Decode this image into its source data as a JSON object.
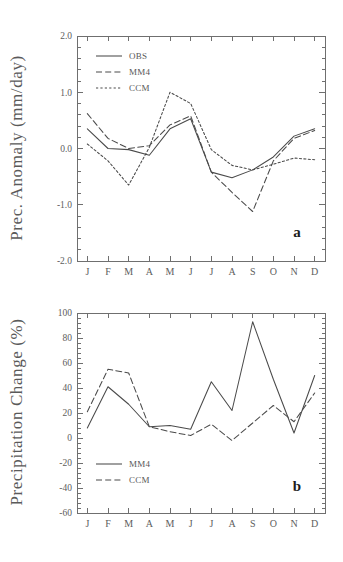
{
  "figure": {
    "panel_a_label": "a",
    "panel_b_label": "b"
  },
  "chart_data": [
    {
      "type": "line",
      "panel": "a",
      "title": "",
      "xlabel": "",
      "ylabel": "Prec. Anomaly (mm/day)",
      "categories": [
        "J",
        "F",
        "M",
        "A",
        "M",
        "J",
        "J",
        "A",
        "S",
        "O",
        "N",
        "D"
      ],
      "xtick_labels": [
        "J",
        "F",
        "M",
        "A",
        "M",
        "J",
        "J",
        "A",
        "S",
        "O",
        "N",
        "D"
      ],
      "ytick_labels": [
        "2.0",
        "1.0",
        "0.0",
        "-1.0",
        "-2.0"
      ],
      "ytick_values": [
        2.0,
        1.0,
        0.0,
        -1.0,
        -2.0
      ],
      "ylim": [
        -2.0,
        2.0
      ],
      "grid": false,
      "legend_position": "upper-left",
      "series": [
        {
          "name": "OBS",
          "style": "solid",
          "values": [
            0.35,
            0.0,
            -0.02,
            -0.12,
            0.35,
            0.53,
            -0.42,
            -0.52,
            -0.38,
            -0.15,
            0.22,
            0.35
          ]
        },
        {
          "name": "MM4",
          "style": "dashed",
          "values": [
            0.62,
            0.18,
            0.0,
            0.05,
            0.42,
            0.58,
            -0.42,
            -0.78,
            -1.12,
            -0.22,
            0.18,
            0.32
          ]
        },
        {
          "name": "CCM",
          "style": "dotted",
          "values": [
            0.08,
            -0.22,
            -0.65,
            0.02,
            1.0,
            0.8,
            -0.02,
            -0.3,
            -0.38,
            -0.28,
            -0.17,
            -0.2
          ]
        }
      ]
    },
    {
      "type": "line",
      "panel": "b",
      "title": "",
      "xlabel": "",
      "ylabel": "Precipitation Change (%)",
      "categories": [
        "J",
        "F",
        "M",
        "A",
        "M",
        "J",
        "J",
        "A",
        "S",
        "O",
        "N",
        "D"
      ],
      "xtick_labels": [
        "J",
        "F",
        "M",
        "A",
        "M",
        "J",
        "J",
        "A",
        "S",
        "O",
        "N",
        "D"
      ],
      "ytick_labels": [
        "100",
        "80",
        "60",
        "40",
        "20",
        "0",
        "-20",
        "-40",
        "-60"
      ],
      "ytick_values": [
        100,
        80,
        60,
        40,
        20,
        0,
        -20,
        -40,
        -60
      ],
      "ylim": [
        -60,
        100
      ],
      "grid": false,
      "legend_position": "lower-left",
      "series": [
        {
          "name": "MM4",
          "style": "solid",
          "values": [
            8,
            41,
            27,
            9,
            10,
            7,
            45,
            22,
            93,
            47,
            4,
            50
          ]
        },
        {
          "name": "CCM",
          "style": "dashed",
          "values": [
            21,
            55,
            52,
            9,
            5,
            2,
            11,
            -2,
            12,
            26,
            13,
            36
          ]
        }
      ]
    }
  ]
}
